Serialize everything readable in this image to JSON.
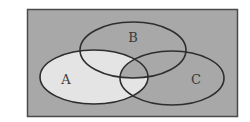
{
  "diagram": {
    "type": "venn",
    "sets": [
      {
        "id": "A",
        "label": "A",
        "cx": 94,
        "cy": 77,
        "rx": 54,
        "ry": 27
      },
      {
        "id": "B",
        "label": "B",
        "cx": 133,
        "cy": 50,
        "rx": 53,
        "ry": 28
      },
      {
        "id": "C",
        "label": "C",
        "cx": 172,
        "cy": 78,
        "rx": 52,
        "ry": 27
      }
    ],
    "universe": {
      "x": 27,
      "y": 9,
      "width": 211,
      "height": 108
    },
    "shaded_region": "A minus (B intersect C)",
    "label_positions": {
      "A": {
        "x": 66,
        "y": 84
      },
      "B": {
        "x": 133,
        "y": 42
      },
      "C": {
        "x": 196,
        "y": 84
      }
    }
  },
  "colors": {
    "universe_fill": "#a8a8a8",
    "highlight_fill": "#e4e4e4",
    "outline": "#2e2e2e",
    "page_background": "#ffffff"
  }
}
